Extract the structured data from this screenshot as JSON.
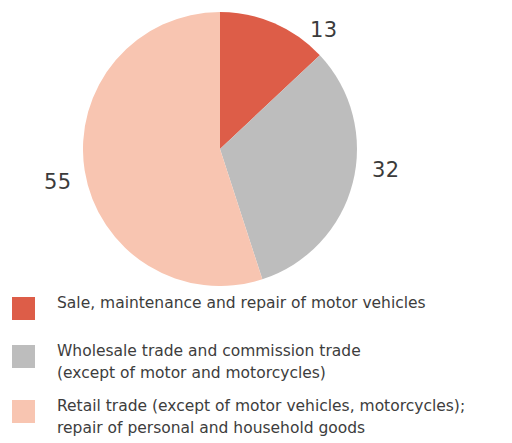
{
  "chart_data": {
    "type": "pie",
    "title": "",
    "subtitle": "",
    "xlabel": "",
    "ylabel": "",
    "legend_position": "bottom-left",
    "grid": false,
    "start_angle_deg": 0,
    "direction": "clockwise",
    "categories": [
      "Sale, maintenance and repair of motor vehicles",
      "Wholesale trade and commission trade (except of motor and motorcycles)",
      "Retail trade (except of motor vehicles, motorcycles); repair of personal and household goods"
    ],
    "values": [
      13,
      32,
      55
    ],
    "value_labels": [
      "13",
      "32",
      "55"
    ],
    "colors": [
      "#dd5d48",
      "#bdbdbd",
      "#f8c5b1"
    ],
    "units": "percent",
    "total": 100
  },
  "pie": {
    "center_x": 220,
    "center_y": 149,
    "radius": 137,
    "slices": [
      {
        "name": "sale-maintenance-repair-motor-vehicles",
        "value": 13,
        "label": "13",
        "color": "#dd5d48",
        "start_deg": 0,
        "end_deg": 46.8
      },
      {
        "name": "wholesale-commission-trade",
        "value": 32,
        "label": "32",
        "color": "#bdbdbd",
        "start_deg": 46.8,
        "end_deg": 162.0
      },
      {
        "name": "retail-trade-repair-household-goods",
        "value": 55,
        "label": "55",
        "color": "#f8c5b1",
        "start_deg": 162.0,
        "end_deg": 360.0
      }
    ]
  },
  "legend": {
    "items": [
      {
        "color": "#dd5d48",
        "label": "Sale, maintenance and repair of motor vehicles"
      },
      {
        "color": "#bdbdbd",
        "label": "Wholesale trade and commission trade\n(except of motor and motorcycles)"
      },
      {
        "color": "#f8c5b1",
        "label": "Retail trade (except of motor vehicles, motorcycles);\nrepair of personal and household goods"
      }
    ]
  }
}
